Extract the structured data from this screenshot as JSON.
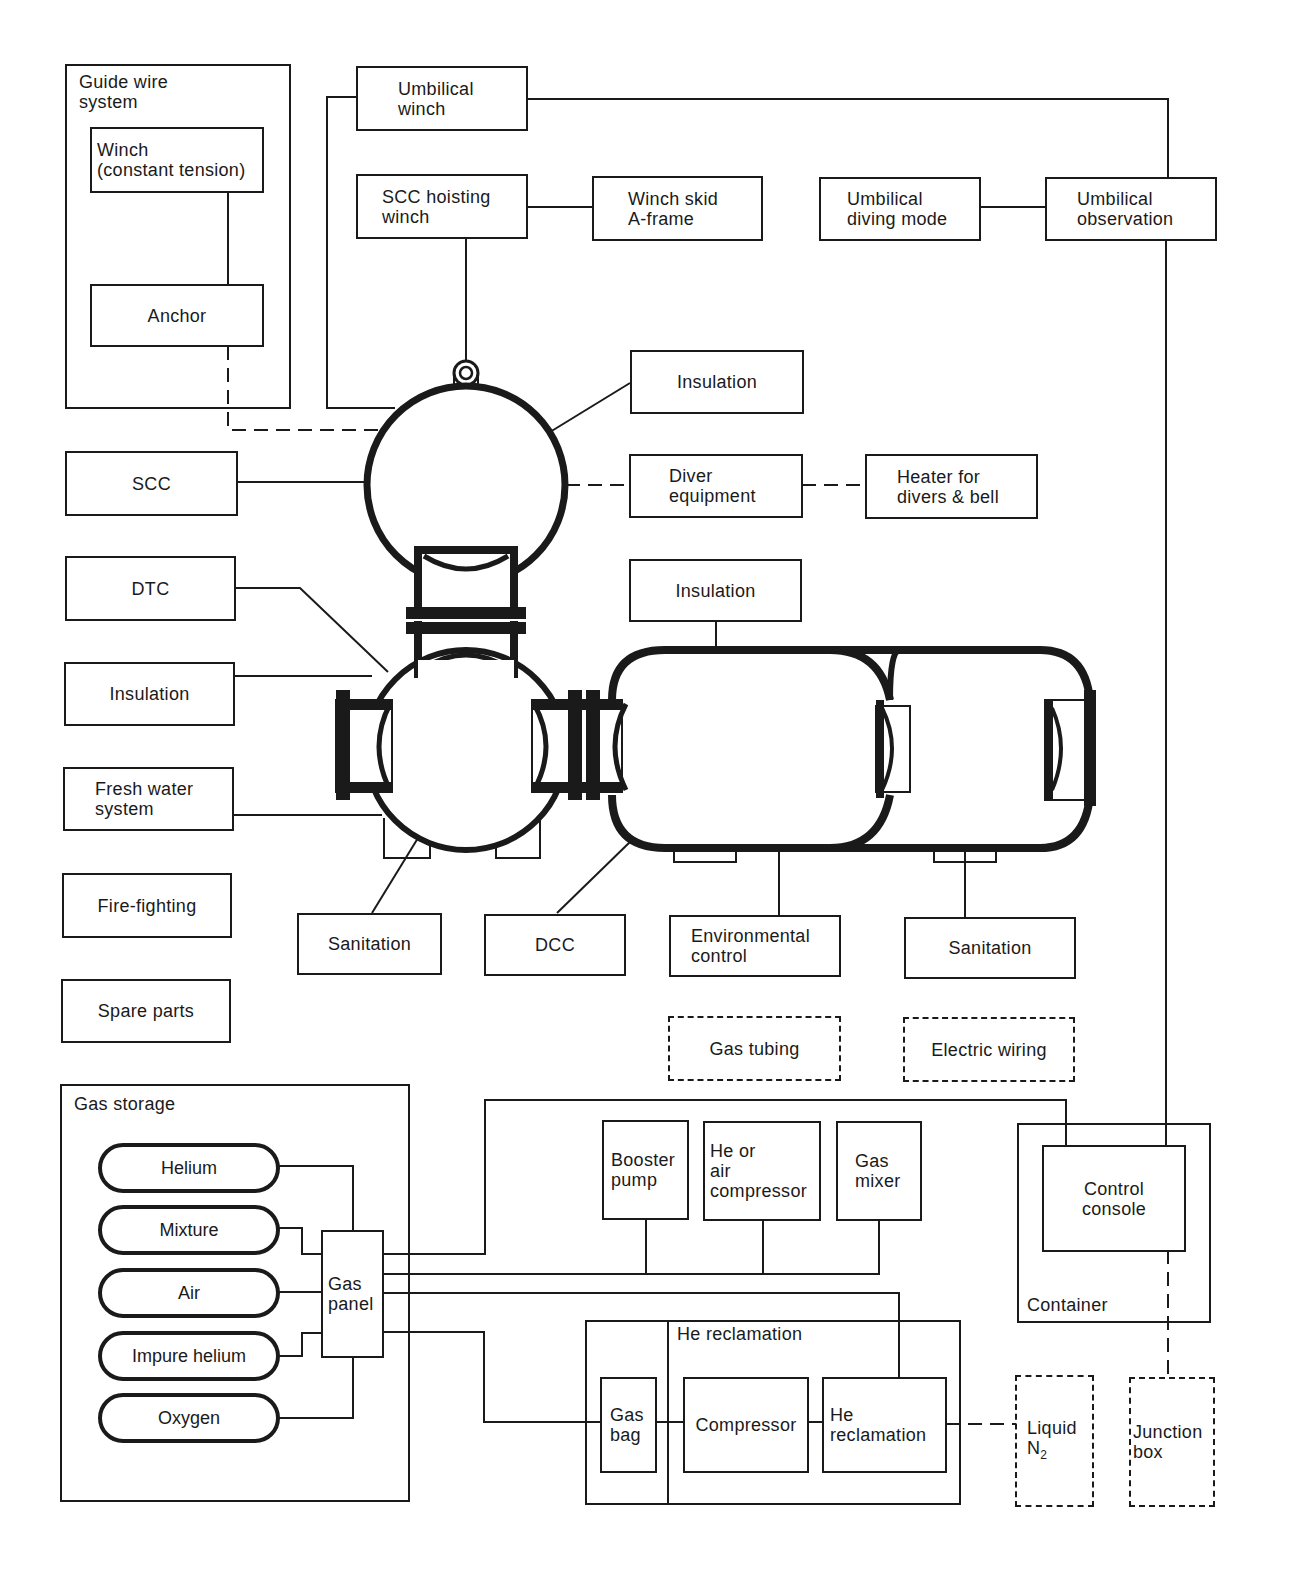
{
  "diagram": {
    "groups": {
      "guide_wire": {
        "label": "Guide wire\nsystem"
      },
      "gas_storage": {
        "label": "Gas storage"
      },
      "he_reclamation": {
        "label": "He reclamation"
      },
      "container": {
        "label": "Container"
      }
    },
    "boxes": {
      "winch_constant_tension": "Winch\n(constant tension)",
      "anchor": "Anchor",
      "umbilical_winch": "Umbilical\nwinch",
      "scc_hoisting_winch": "SCC hoisting\nwinch",
      "winch_skid": "Winch skid\nA-frame",
      "umbilical_diving_mode": "Umbilical\ndiving mode",
      "umbilical_observation": "Umbilical\nobservation",
      "insulation_scc": "Insulation",
      "diver_equipment": "Diver\nequipment",
      "heater": "Heater for\ndivers & bell",
      "scc": "SCC",
      "dtc": "DTC",
      "insulation_dtc": "Insulation",
      "fresh_water": "Fresh water\nsystem",
      "fire_fighting": "Fire-fighting",
      "spare_parts": "Spare parts",
      "insulation_dcc": "Insulation",
      "sanitation_dtc": "Sanitation",
      "dcc": "DCC",
      "environmental_control": "Environmental\ncontrol",
      "sanitation_dcc": "Sanitation",
      "gas_tubing": "Gas tubing",
      "electric_wiring": "Electric wiring",
      "gas_panel": "Gas\npanel",
      "booster_pump": "Booster\npump",
      "he_air_compressor": "He or\nair\ncompressor",
      "gas_mixer": "Gas\nmixer",
      "control_console": "Control\nconsole",
      "gas_bag": "Gas\nbag",
      "compressor": "Compressor",
      "he_reclamation_unit": "He\nreclamation",
      "liquid_n2_prefix": "Liquid\nN",
      "liquid_n2_sub": "2",
      "junction_box": "Junction\nbox"
    },
    "gas_bottles": [
      "Helium",
      "Mixture",
      "Air",
      "Impure helium",
      "Oxygen"
    ],
    "legend": {
      "solid_line": "direct connection",
      "dashed_line": "auxiliary / optional connection",
      "dashed_box": "distributed item"
    },
    "colors": {
      "ink": "#1a1a1a",
      "paper": "#ffffff"
    }
  }
}
